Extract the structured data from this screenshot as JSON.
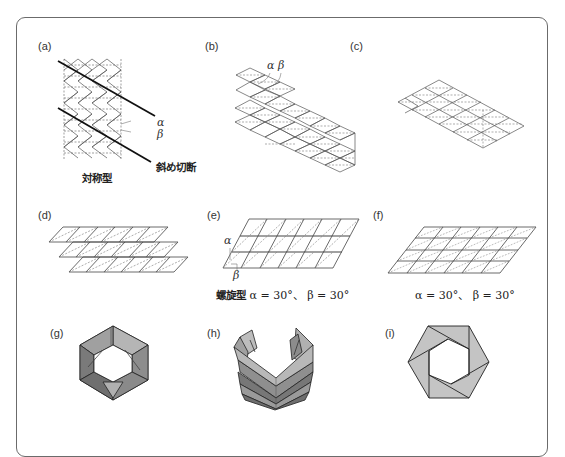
{
  "figure": {
    "panels": [
      {
        "id": "a",
        "label": "(a)",
        "caption": "対称型",
        "annotations": {
          "alpha": "α",
          "beta": "β",
          "cut": "斜め切断"
        }
      },
      {
        "id": "b",
        "label": "(b)",
        "annotations": {
          "alpha_beta": "α β"
        }
      },
      {
        "id": "c",
        "label": "(c)"
      },
      {
        "id": "d",
        "label": "(d)"
      },
      {
        "id": "e",
        "label": "(e)",
        "annotations": {
          "alpha": "α",
          "beta": "β"
        },
        "caption_prefix": "螺旋型",
        "caption": "α = 30°、 β = 30°"
      },
      {
        "id": "f",
        "label": "(f)",
        "caption": "α = 30°、 β = 30°"
      },
      {
        "id": "g",
        "label": "(g)"
      },
      {
        "id": "h",
        "label": "(h)"
      },
      {
        "id": "i",
        "label": "(i)"
      }
    ],
    "colors": {
      "frame": "#6b6b6b",
      "line": "#444444",
      "dash": "#666666",
      "cut": "#111111",
      "face_light": "#c8c8c8",
      "face_mid": "#a8a8a8",
      "face_dark": "#7a7a7a"
    }
  }
}
